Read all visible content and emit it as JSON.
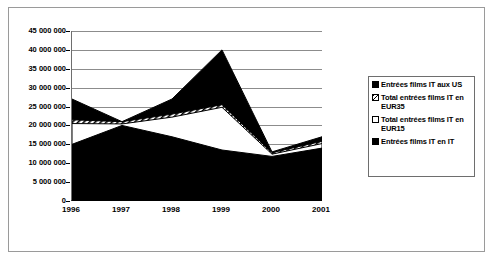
{
  "chart_data": {
    "type": "area",
    "title": "",
    "subtitle": "",
    "xlabel": "",
    "ylabel": "",
    "categories": [
      "1996",
      "1997",
      "1998",
      "1999",
      "2000",
      "2001"
    ],
    "ylim": [
      0,
      45000000
    ],
    "ytick_labels": [
      "45 000 000",
      "40 000 000",
      "35 000 000",
      "30 000 000",
      "25 000 000",
      "20 000 000",
      "15 000 000",
      "10 000 000",
      "5 000 000",
      "0"
    ],
    "ytick_values": [
      45000000,
      40000000,
      35000000,
      30000000,
      25000000,
      20000000,
      15000000,
      10000000,
      5000000,
      0
    ],
    "ytick_step": 5000000,
    "grid": true,
    "legend_position": "right",
    "series": [
      {
        "name": "Entrées films IT aux US",
        "color": "#000000",
        "style": "black",
        "values": [
          27000000,
          21000000,
          27000000,
          40000000,
          13000000,
          17000000
        ]
      },
      {
        "name": "Total entrées films IT en EUR35",
        "color": "#808080",
        "style": "hatched-gray",
        "values": [
          21500000,
          21000000,
          23000000,
          25500000,
          12800000,
          15800000
        ]
      },
      {
        "name": "Total entrées films IT en EUR15",
        "color": "#ffffff",
        "style": "white",
        "values": [
          20500000,
          20400000,
          22200000,
          24800000,
          12400000,
          15200000
        ]
      },
      {
        "name": "Entrées films IT en IT",
        "color": "#000000",
        "style": "black",
        "values": [
          15000000,
          20000000,
          17000000,
          13500000,
          11800000,
          14000000
        ]
      }
    ]
  },
  "legend": {
    "items": [
      {
        "label": "Entrées films IT aux US",
        "swatch": "black-swatch"
      },
      {
        "label": "Total entrées films IT en EUR35",
        "swatch": "hatched-swatch"
      },
      {
        "label": "Total entrées films IT en EUR15",
        "swatch": "white-swatch"
      },
      {
        "label": "Entrées films IT en IT",
        "swatch": "black-swatch"
      }
    ]
  }
}
